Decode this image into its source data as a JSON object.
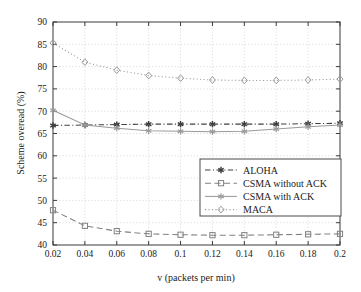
{
  "chart_data": {
    "type": "line",
    "title": "",
    "xlabel": "v (packets per min)",
    "ylabel": "Scheme overead (%)",
    "xlim": [
      0.02,
      0.2
    ],
    "ylim": [
      40,
      90
    ],
    "grid": true,
    "legend_position": "center-right",
    "x": [
      0.02,
      0.04,
      0.06,
      0.08,
      0.1,
      0.12,
      0.14,
      0.16,
      0.18,
      0.2
    ],
    "xticks": [
      "0.02",
      "0.04",
      "0.06",
      "0.08",
      "0.1",
      "0.12",
      "0.14",
      "0.16",
      "0.18",
      "0.2"
    ],
    "yticks": [
      "40",
      "45",
      "50",
      "55",
      "60",
      "65",
      "70",
      "75",
      "80",
      "85",
      "90"
    ],
    "series": [
      {
        "name": "ALOHA",
        "marker": "asterisk",
        "line": "dash-dot",
        "color": "#404040",
        "values": [
          66.8,
          66.9,
          67.0,
          67.1,
          67.1,
          67.1,
          67.1,
          67.1,
          67.2,
          67.3
        ]
      },
      {
        "name": "CSMA without ACK",
        "marker": "square",
        "line": "dashed",
        "color": "#808080",
        "values": [
          47.8,
          44.3,
          43.1,
          42.5,
          42.3,
          42.2,
          42.2,
          42.3,
          42.4,
          42.5
        ]
      },
      {
        "name": "CSMA with ACK",
        "marker": "star",
        "line": "solid",
        "color": "#9a9a9a",
        "values": [
          70.2,
          66.9,
          66.2,
          65.6,
          65.5,
          65.4,
          65.5,
          66.0,
          66.5,
          66.9
        ]
      },
      {
        "name": "MACA",
        "marker": "diamond",
        "line": "dotted",
        "color": "#9a9a9a",
        "values": [
          85.3,
          81.0,
          79.2,
          78.0,
          77.4,
          77.0,
          76.9,
          76.9,
          77.0,
          77.2
        ]
      }
    ]
  },
  "legend": {
    "entries": [
      {
        "label": "ALOHA"
      },
      {
        "label": "CSMA without ACK"
      },
      {
        "label": "CSMA with ACK"
      },
      {
        "label": "MACA"
      }
    ]
  },
  "axes": {
    "x_title": "v (packets per min)",
    "y_title": "Scheme overead (%)"
  }
}
